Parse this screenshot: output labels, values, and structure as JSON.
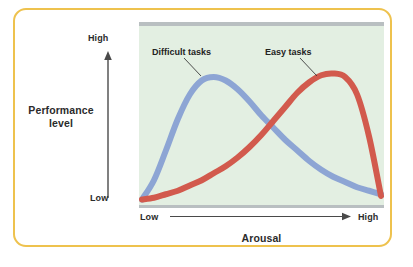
{
  "figure": {
    "border_color": "#eec24e",
    "panel_color": "#e3efe2",
    "band_color": "#b9bfc1"
  },
  "axes": {
    "y_title": "Performance level",
    "y_high_label": "High",
    "y_low_label": "Low",
    "x_title": "Arousal",
    "x_low_label": "Low",
    "x_high_label": "High"
  },
  "annotations": {
    "difficult_label": "Difficult tasks",
    "easy_label": "Easy tasks"
  },
  "chart_data": {
    "type": "line",
    "title": "",
    "subtitle": "",
    "xlabel": "Arousal",
    "ylabel": "Performance level",
    "xlim": [
      0,
      1
    ],
    "ylim": [
      0,
      1
    ],
    "x_tick_labels": [
      "Low",
      "High"
    ],
    "y_tick_labels": [
      "Low",
      "High"
    ],
    "grid": false,
    "legend": "inline-annotations",
    "x": [
      0.0,
      0.05,
      0.1,
      0.15,
      0.2,
      0.25,
      0.3,
      0.35,
      0.4,
      0.45,
      0.5,
      0.55,
      0.6,
      0.65,
      0.7,
      0.75,
      0.8,
      0.85,
      0.9,
      0.95,
      1.0
    ],
    "series": [
      {
        "name": "Difficult tasks",
        "color": "#8da5d4",
        "peak_x": 0.27,
        "peak_y": 0.72,
        "values": [
          0.02,
          0.13,
          0.3,
          0.48,
          0.62,
          0.7,
          0.72,
          0.7,
          0.65,
          0.58,
          0.5,
          0.43,
          0.36,
          0.3,
          0.24,
          0.19,
          0.15,
          0.12,
          0.09,
          0.07,
          0.05
        ]
      },
      {
        "name": "Easy tasks",
        "color": "#d25a4d",
        "peak_x": 0.76,
        "peak_y": 0.74,
        "values": [
          0.02,
          0.03,
          0.05,
          0.07,
          0.1,
          0.13,
          0.17,
          0.21,
          0.26,
          0.32,
          0.39,
          0.47,
          0.55,
          0.63,
          0.69,
          0.73,
          0.74,
          0.72,
          0.62,
          0.38,
          0.04
        ]
      }
    ]
  }
}
